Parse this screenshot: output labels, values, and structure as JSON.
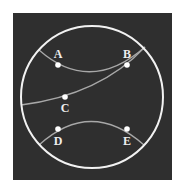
{
  "diagram": {
    "type": "poincare-disk",
    "colors": {
      "page_background": "#ffffff",
      "panel_background": "#2f2f2f",
      "boundary_circle": "#f2f2f2",
      "geodesic": "#a8a8a8",
      "point_fill": "#ffffff",
      "label": "#eeeeee"
    },
    "points": [
      {
        "id": "A",
        "label": "A"
      },
      {
        "id": "B",
        "label": "B"
      },
      {
        "id": "C",
        "label": "C"
      },
      {
        "id": "D",
        "label": "D"
      },
      {
        "id": "E",
        "label": "E"
      }
    ],
    "geodesics": [
      {
        "name": "line-AB",
        "through": [
          "A",
          "B"
        ]
      },
      {
        "name": "line-CB",
        "through": [
          "C",
          "B"
        ]
      },
      {
        "name": "line-DE",
        "through": [
          "D",
          "E"
        ]
      }
    ]
  }
}
